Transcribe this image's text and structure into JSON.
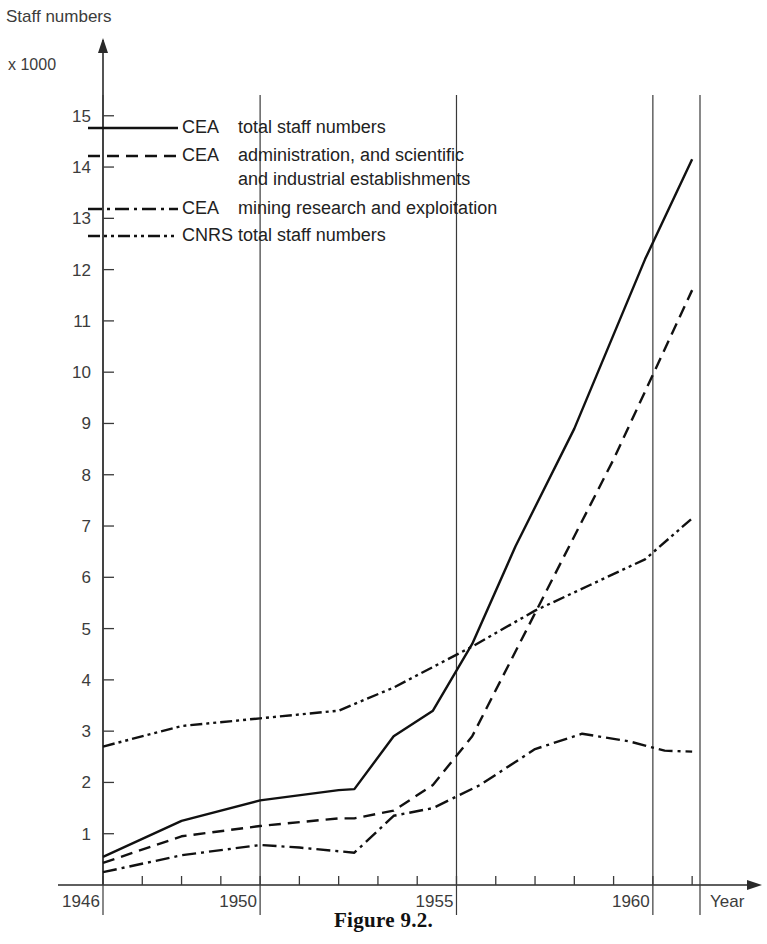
{
  "figure": {
    "caption": "Figure 9.2.",
    "y_axis_title": "Staff numbers",
    "y_axis_unit": "x 1000",
    "x_axis_title": "Year"
  },
  "legend": {
    "entries": [
      {
        "key": "CEA",
        "description": "total staff numbers",
        "style": "solid"
      },
      {
        "key": "CEA",
        "description": "administration, and scientific",
        "description2": "and industrial establishments",
        "style": "dashed"
      },
      {
        "key": "CEA",
        "description": "mining research and exploitation",
        "style": "dash-dot"
      },
      {
        "key": "CNRS",
        "description": "total staff numbers",
        "style": "dash-dot-dot"
      }
    ]
  },
  "chart_data": {
    "type": "line",
    "title": "Figure 9.2.",
    "xlabel": "Year",
    "ylabel": "Staff numbers",
    "yunit": "x 1000",
    "xlim": [
      1946,
      1961.2
    ],
    "ylim": [
      0,
      15.6
    ],
    "xticks": [
      1946,
      1947,
      1948,
      1949,
      1950,
      1951,
      1952,
      1953,
      1954,
      1955,
      1956,
      1957,
      1958,
      1959,
      1960,
      1961
    ],
    "xtick_labels": [
      "1946",
      "",
      "",
      "",
      "1950",
      "",
      "",
      "",
      "",
      "1955",
      "",
      "",
      "",
      "",
      "1960",
      ""
    ],
    "x_major_gridlines": [
      1946,
      1950,
      1955,
      1960,
      1961.2
    ],
    "yticks": [
      1,
      2,
      3,
      4,
      5,
      6,
      7,
      8,
      9,
      10,
      11,
      12,
      13,
      14,
      15
    ],
    "grid": false,
    "legend_position": "upper-left",
    "series": [
      {
        "name": "CEA total staff numbers",
        "style": "solid",
        "dasharray": "",
        "x": [
          1946,
          1948,
          1950,
          1952,
          1952.4,
          1953.4,
          1954.4,
          1955.4,
          1956.5,
          1958,
          1959.8,
          1961
        ],
        "values": [
          0.55,
          1.25,
          1.65,
          1.85,
          1.87,
          2.9,
          3.4,
          4.7,
          6.6,
          8.9,
          12.2,
          14.15
        ]
      },
      {
        "name": "CEA administration, and scientific and industrial establishments",
        "style": "dashed",
        "dasharray": "12,7",
        "x": [
          1946,
          1948,
          1950,
          1952,
          1952.4,
          1953.4,
          1954.4,
          1955.4,
          1957,
          1959,
          1961
        ],
        "values": [
          0.43,
          0.95,
          1.15,
          1.3,
          1.3,
          1.45,
          1.95,
          2.9,
          5.3,
          8.3,
          11.6
        ]
      },
      {
        "name": "CEA mining research and exploitation",
        "style": "dash-dot",
        "dasharray": "14,5,3,5",
        "x": [
          1946,
          1948,
          1950,
          1951,
          1952.4,
          1953.4,
          1954.4,
          1955.6,
          1957,
          1958.2,
          1959.4,
          1960.3,
          1961
        ],
        "values": [
          0.25,
          0.58,
          0.78,
          0.73,
          0.63,
          1.35,
          1.5,
          1.95,
          2.65,
          2.95,
          2.8,
          2.62,
          2.6
        ]
      },
      {
        "name": "CNRS total staff numbers",
        "style": "dash-dot-dot",
        "dasharray": "12,4,3,4,3,4",
        "x": [
          1946,
          1948,
          1950,
          1952,
          1953.4,
          1955.4,
          1957,
          1958.4,
          1959.8,
          1961
        ],
        "values": [
          2.7,
          3.1,
          3.25,
          3.4,
          3.85,
          4.65,
          5.35,
          5.85,
          6.35,
          7.15
        ]
      }
    ]
  }
}
